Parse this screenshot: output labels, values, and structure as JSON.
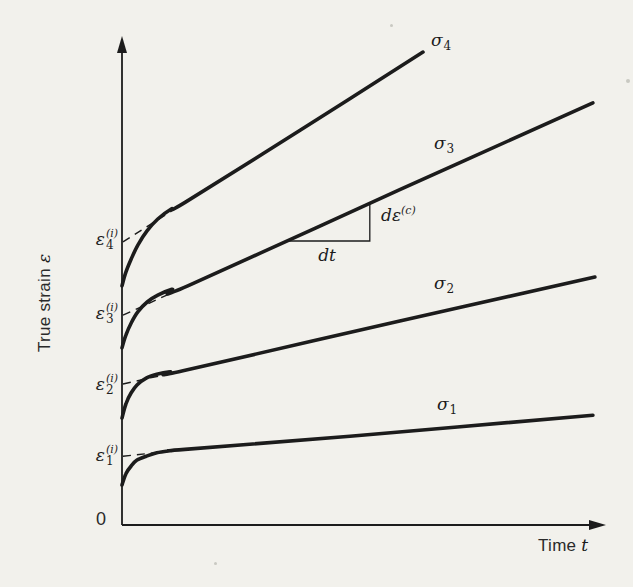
{
  "figure": {
    "background": "#f2f1ec",
    "ink": "#1c1c1c"
  },
  "chart_data": {
    "type": "line",
    "title": "",
    "xlabel": {
      "text": "Time",
      "symbol": "t"
    },
    "ylabel": {
      "text": "True strain",
      "symbol": "ε"
    },
    "origin_label": "0",
    "axes": {
      "x_range": [
        0,
        1
      ],
      "y_range": [
        0,
        1
      ],
      "x_ticks": [],
      "y_ticks": [],
      "grid": false,
      "style": "arrowed qualitative axes, no numeric scale"
    },
    "series": [
      {
        "name": "sigma-1",
        "label": {
          "base": "σ",
          "sub": "1"
        },
        "points": [
          [
            0.0,
            0.082
          ],
          [
            0.008,
            0.105
          ],
          [
            0.019,
            0.121
          ],
          [
            0.031,
            0.133
          ],
          [
            0.05,
            0.141
          ],
          [
            0.072,
            0.148
          ],
          [
            0.099,
            0.152
          ],
          [
            0.13,
            0.155
          ],
          [
            0.471,
            0.182
          ],
          [
            0.973,
            0.225
          ]
        ]
      },
      {
        "name": "sigma-2",
        "label": {
          "base": "σ",
          "sub": "2"
        },
        "points": [
          [
            0.0,
            0.219
          ],
          [
            0.008,
            0.248
          ],
          [
            0.019,
            0.271
          ],
          [
            0.031,
            0.287
          ],
          [
            0.05,
            0.301
          ],
          [
            0.072,
            0.309
          ],
          [
            0.099,
            0.314
          ],
          [
            0.126,
            0.316
          ],
          [
            0.574,
            0.418
          ],
          [
            0.977,
            0.508
          ]
        ]
      },
      {
        "name": "sigma-3",
        "label": {
          "base": "σ",
          "sub": "3"
        },
        "points": [
          [
            0.0,
            0.363
          ],
          [
            0.008,
            0.389
          ],
          [
            0.019,
            0.414
          ],
          [
            0.033,
            0.437
          ],
          [
            0.052,
            0.457
          ],
          [
            0.074,
            0.471
          ],
          [
            0.103,
            0.483
          ],
          [
            0.136,
            0.49
          ],
          [
            0.574,
            0.687
          ],
          [
            0.973,
            0.865
          ]
        ]
      },
      {
        "name": "sigma-4",
        "label": {
          "base": "σ",
          "sub": "4"
        },
        "points": [
          [
            0.0,
            0.49
          ],
          [
            0.008,
            0.518
          ],
          [
            0.019,
            0.545
          ],
          [
            0.033,
            0.574
          ],
          [
            0.052,
            0.603
          ],
          [
            0.074,
            0.627
          ],
          [
            0.101,
            0.647
          ],
          [
            0.132,
            0.662
          ],
          [
            0.368,
            0.809
          ],
          [
            0.622,
            0.969
          ]
        ]
      }
    ],
    "intercepts": [
      {
        "label": {
          "base": "ε",
          "sub": "1",
          "sup": "(i)"
        },
        "value": 0.141,
        "dash": [
          [
            0.002,
            0.141
          ],
          [
            0.116,
            0.153
          ]
        ]
      },
      {
        "label": {
          "base": "ε",
          "sub": "2",
          "sup": "(i)"
        },
        "value": 0.289,
        "dash": [
          [
            0.002,
            0.289
          ],
          [
            0.116,
            0.314
          ]
        ]
      },
      {
        "label": {
          "base": "ε",
          "sub": "3",
          "sup": "(i)"
        },
        "value": 0.43,
        "dash": [
          [
            0.002,
            0.43
          ],
          [
            0.128,
            0.487
          ]
        ]
      },
      {
        "label": {
          "base": "ε",
          "sub": "4",
          "sup": "(i)"
        },
        "value": 0.58,
        "dash": [
          [
            0.002,
            0.58
          ],
          [
            0.124,
            0.657
          ]
        ]
      }
    ],
    "slope_annotation": {
      "dt_label": "dt",
      "de_label": {
        "base": "dε",
        "sup": "(c)"
      },
      "triangle": [
        [
          0.343,
          0.582
        ],
        [
          0.512,
          0.582
        ],
        [
          0.512,
          0.658
        ]
      ]
    },
    "legend": {
      "position": "inline-curve-labels"
    }
  }
}
